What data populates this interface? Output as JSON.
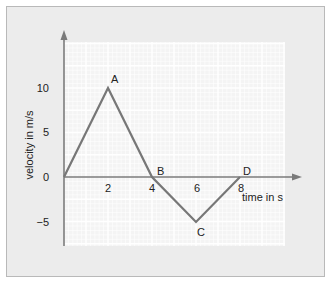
{
  "chart_data": {
    "type": "line",
    "title": "",
    "xlabel": "time in s",
    "ylabel": "velocity in m/s",
    "x": [
      0,
      2,
      4,
      6,
      8
    ],
    "series": [
      {
        "name": "velocity",
        "values": [
          0,
          10,
          0,
          -5,
          0
        ],
        "color": "#777777"
      }
    ],
    "points": [
      {
        "label": "A",
        "x": 2,
        "y": 10
      },
      {
        "label": "B",
        "x": 4,
        "y": 0
      },
      {
        "label": "C",
        "x": 6,
        "y": -5
      },
      {
        "label": "D",
        "x": 8,
        "y": 0
      }
    ],
    "x_ticks": [
      "2",
      "4",
      "6",
      "8"
    ],
    "y_ticks": [
      "10",
      "5",
      "0",
      "-5"
    ],
    "xlim": [
      0,
      10
    ],
    "ylim": [
      -7.5,
      12
    ],
    "grid": true,
    "legend": "none"
  },
  "labels": {
    "x_axis": "time in s",
    "y_axis": "velocity in m/s",
    "x_tick_2": "2",
    "x_tick_4": "4",
    "x_tick_6": "6",
    "x_tick_8": "8",
    "y_tick_10": "10",
    "y_tick_5": "5",
    "y_tick_0": "0",
    "y_tick_neg5": "−5",
    "point_a": "A",
    "point_b": "B",
    "point_c": "C",
    "point_d": "D"
  },
  "colors": {
    "frame_bg": "#ececec",
    "plot_bg": "#f4f4f4",
    "line": "#777777",
    "axis": "#7a7a7a"
  }
}
